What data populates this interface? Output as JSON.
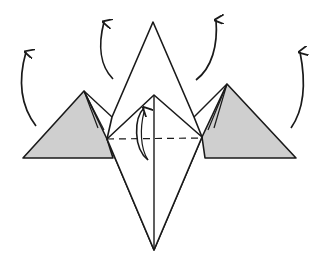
{
  "diagram": {
    "colors": {
      "background": "#ffffff",
      "line": "#1a1a1a",
      "shaded_flap": "#cfcfcf",
      "paper": "#ffffff"
    },
    "elements": {
      "left_flap": "shaded-left-pyramid",
      "right_flap": "shaded-right-pyramid",
      "center_kite": "white-center-kite",
      "valley_fold": "dashed-horizontal-fold-line",
      "arrows": [
        "lift-arrow-far-left",
        "lift-arrow-left",
        "lift-arrow-right",
        "lift-arrow-far-right",
        "fold-up-arrow-center"
      ]
    }
  }
}
